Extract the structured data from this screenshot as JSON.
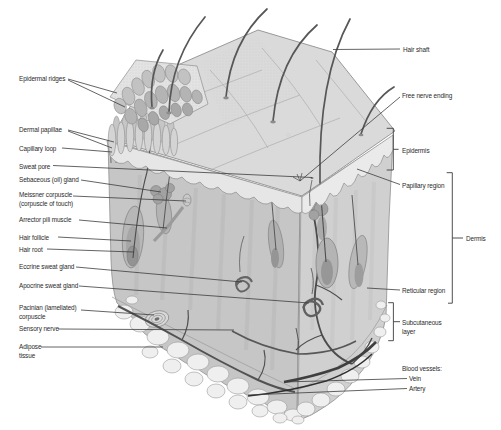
{
  "figure": {
    "kind": "skin-anatomy-block-diagram",
    "colors": {
      "background": "#ffffff",
      "text": "#2b2b2b",
      "leader_line": "#3c3c3c",
      "illustration_base": "#c9c9c9"
    },
    "labels": {
      "left": [
        {
          "id": "epidermal-ridges",
          "text": "Epidermal ridges"
        },
        {
          "id": "dermal-papillae",
          "text": "Dermal papillae"
        },
        {
          "id": "capillary-loop",
          "text": "Capillary loop"
        },
        {
          "id": "sweat-pore",
          "text": "Sweat pore"
        },
        {
          "id": "sebaceous-gland",
          "text": "Sebaceous (oil) gland"
        },
        {
          "id": "meissner-corpuscle",
          "text": "Meissner corpuscle\n(corpuscle of touch)"
        },
        {
          "id": "arrector-pili",
          "text": "Arrector pili muscle"
        },
        {
          "id": "hair-follicle",
          "text": "Hair follicle"
        },
        {
          "id": "hair-root",
          "text": "Hair root"
        },
        {
          "id": "eccrine-sweat-gland",
          "text": "Eccrine sweat gland"
        },
        {
          "id": "apocrine-sweat-gland",
          "text": "Apocrine sweat gland"
        },
        {
          "id": "pacinian-corpuscle",
          "text": "Pacinian (lamellated)\ncorpuscle"
        },
        {
          "id": "sensory-nerve",
          "text": "Sensory nerve"
        },
        {
          "id": "adipose-tissue",
          "text": "Adipose\ntissue"
        }
      ],
      "right": [
        {
          "id": "hair-shaft",
          "text": "Hair shaft"
        },
        {
          "id": "free-nerve-ending",
          "text": "Free nerve ending"
        },
        {
          "id": "epidermis",
          "text": "Epidermis"
        },
        {
          "id": "papillary-region",
          "text": "Papillary region"
        },
        {
          "id": "dermis",
          "text": "Dermis"
        },
        {
          "id": "reticular-region",
          "text": "Reticular region"
        },
        {
          "id": "subcutaneous-layer",
          "text": "Subcutaneous\nlayer"
        },
        {
          "id": "blood-vessels",
          "text": "Blood vessels:"
        },
        {
          "id": "vein",
          "text": "Vein"
        },
        {
          "id": "artery",
          "text": "Artery"
        }
      ]
    }
  }
}
